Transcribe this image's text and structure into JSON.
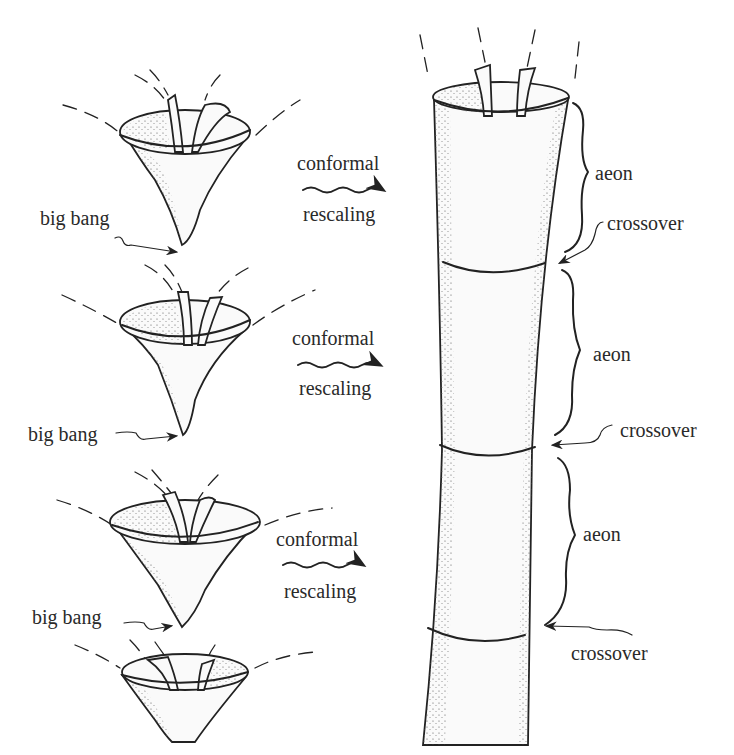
{
  "figure": {
    "left_column": {
      "cones": [
        {
          "id": "cone-1",
          "big_bang_label": "big bang",
          "arrow_top_label": "conformal",
          "arrow_bottom_label": "rescaling"
        },
        {
          "id": "cone-2",
          "big_bang_label": "big bang",
          "arrow_top_label": "conformal",
          "arrow_bottom_label": "rescaling"
        },
        {
          "id": "cone-3",
          "big_bang_label": "big bang",
          "arrow_top_label": "conformal",
          "arrow_bottom_label": "rescaling"
        },
        {
          "id": "cone-4",
          "big_bang_label": "",
          "arrow_top_label": "",
          "arrow_bottom_label": ""
        }
      ]
    },
    "right_column": {
      "segments": [
        {
          "aeon_label": "aeon",
          "crossover_label": "crossover"
        },
        {
          "aeon_label": "aeon",
          "crossover_label": "crossover"
        },
        {
          "aeon_label": "aeon",
          "crossover_label": "crossover"
        }
      ]
    },
    "colors": {
      "ink": "#222222",
      "paper": "#ffffff",
      "text": "#2a2a2a"
    }
  }
}
